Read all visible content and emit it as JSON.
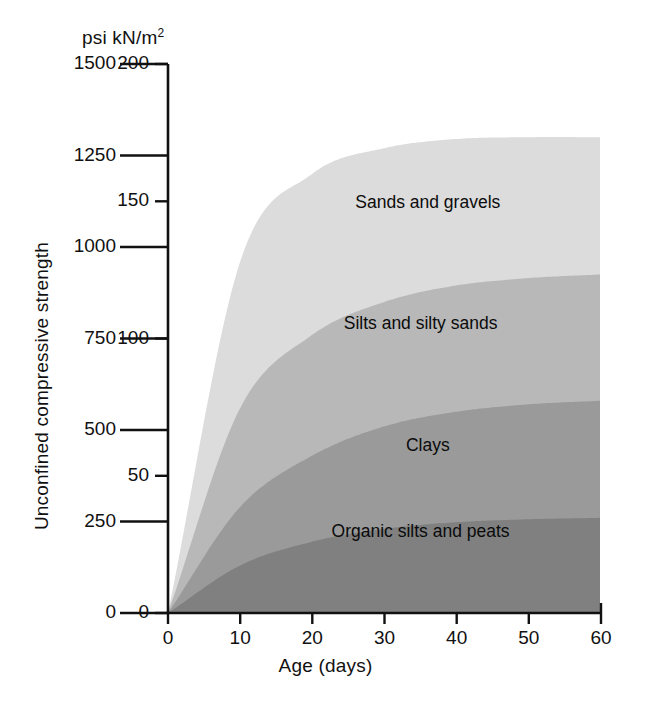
{
  "chart_data": {
    "type": "area",
    "title": "",
    "subtitle": "",
    "unit_header": "psi kN/m",
    "unit_header_sup": "2",
    "xlabel": "Age (days)",
    "ylabel": "Unconfined compressive strength",
    "grid": false,
    "legend": "inline-band-labels",
    "x": [
      0,
      10,
      20,
      30,
      40,
      50,
      60
    ],
    "xlim": [
      0,
      60
    ],
    "xticks": [
      "0",
      "10",
      "20",
      "30",
      "40",
      "50",
      "60"
    ],
    "y_axis_primary": {
      "name": "psi",
      "lim": [
        0,
        1500
      ],
      "ticks": [
        "0",
        "250",
        "500",
        "750",
        "1000",
        "1250",
        "1500"
      ],
      "tickvalues": [
        0,
        250,
        500,
        750,
        1000,
        1250,
        1500
      ]
    },
    "y_axis_secondary": {
      "name": "kN/m2",
      "lim": [
        0,
        200
      ],
      "ticks": [
        "0",
        "50",
        "100",
        "150",
        "200"
      ],
      "tickvalues": [
        0,
        50,
        100,
        150,
        200
      ]
    },
    "series": [
      {
        "name": "Sands and gravels",
        "fill": "#dcdcdc",
        "label_x": 36,
        "label_y_psi": 1120,
        "upper_boundary_psi": [
          0,
          960,
          1200,
          1270,
          1295,
          1300,
          1300
        ],
        "values": [
          0,
          960,
          1200,
          1270,
          1295,
          1300,
          1300
        ]
      },
      {
        "name": "Silts and silty sands",
        "fill": "#b8b8b8",
        "label_x": 35,
        "label_y_psi": 790,
        "upper_boundary_psi": [
          0,
          560,
          760,
          850,
          895,
          915,
          925
        ],
        "values": [
          0,
          560,
          760,
          850,
          895,
          915,
          925
        ]
      },
      {
        "name": "Clays",
        "fill": "#9a9a9a",
        "label_x": 36,
        "label_y_psi": 455,
        "upper_boundary_psi": [
          0,
          290,
          430,
          510,
          550,
          570,
          580
        ],
        "values": [
          0,
          290,
          430,
          510,
          550,
          570,
          580
        ]
      },
      {
        "name": "Organic silts and peats",
        "fill": "#808080",
        "label_x": 35,
        "label_y_psi": 220,
        "upper_boundary_psi": [
          0,
          130,
          195,
          230,
          248,
          256,
          260
        ],
        "values": [
          0,
          130,
          195,
          230,
          248,
          256,
          260
        ]
      }
    ],
    "axis_color": "#111111",
    "background": "#ffffff"
  }
}
